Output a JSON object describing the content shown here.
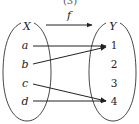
{
  "diagram": {
    "top_label": "(3)",
    "function_label": "f",
    "domain": {
      "name": "X",
      "elements": [
        "a",
        "b",
        "c",
        "d"
      ]
    },
    "codomain": {
      "name": "Y",
      "elements": [
        "1",
        "2",
        "3",
        "4"
      ]
    },
    "mappings": [
      {
        "from": "a",
        "to": "1"
      },
      {
        "from": "b",
        "to": "1"
      },
      {
        "from": "c",
        "to": "4"
      },
      {
        "from": "d",
        "to": "4"
      }
    ],
    "colors": {
      "stroke": "#333333",
      "text": "#222222",
      "background": "#ffffff"
    }
  }
}
